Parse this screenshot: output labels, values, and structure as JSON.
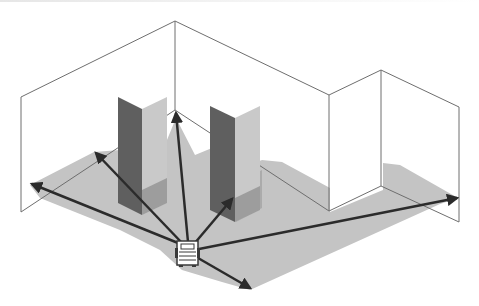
{
  "diagram": {
    "title": "Scanner emitting rays inside a room with pillars",
    "colors": {
      "background": "#ffffff",
      "wall_line": "#6e6e6e",
      "floor_shadow": "#c4c4c4",
      "floor_shadow_dark": "#a9a9a9",
      "pillar_dark": "#5f5f5f",
      "pillar_light": "#c9c9c9",
      "ray": "#2b2b2b",
      "device": "#3a3a3a"
    },
    "elements": {
      "device": {
        "label": "scanner device",
        "x": 186,
        "y": 256
      },
      "rays": [
        {
          "name": "ray-far-left",
          "to": [
            30,
            185
          ]
        },
        {
          "name": "ray-left",
          "to": [
            94,
            152
          ]
        },
        {
          "name": "ray-up",
          "to": [
            176,
            112
          ]
        },
        {
          "name": "ray-mid-right",
          "to": [
            232,
            198
          ]
        },
        {
          "name": "ray-right",
          "to": [
            458,
            198
          ]
        },
        {
          "name": "ray-down-right",
          "to": [
            250,
            290
          ]
        }
      ],
      "pillars": [
        {
          "name": "pillar-left"
        },
        {
          "name": "pillar-right"
        }
      ],
      "walls": [
        {
          "name": "wall-left"
        },
        {
          "name": "wall-back"
        },
        {
          "name": "wall-right-alcove"
        },
        {
          "name": "wall-right"
        }
      ]
    }
  }
}
